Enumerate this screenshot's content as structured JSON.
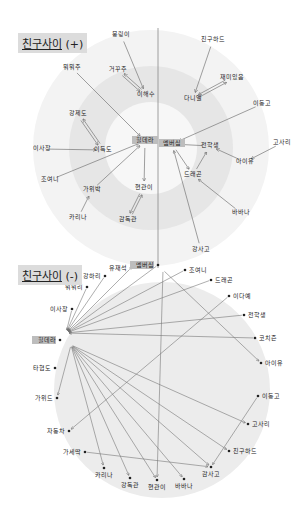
{
  "diagram_positive": {
    "title": "친구사이",
    "suffix": "(+)",
    "center": [
      151,
      148
    ],
    "rings": [
      {
        "r": 118,
        "color": "#f3f3f3"
      },
      {
        "r": 82,
        "color": "#e6e6e6"
      },
      {
        "r": 46,
        "color": "#f7f7f7"
      }
    ],
    "divider_x": 158,
    "nodes": [
      {
        "id": "p1",
        "label": "뭉링이",
        "x": 121,
        "y": 35
      },
      {
        "id": "p2",
        "label": "뭐뭐주",
        "x": 72,
        "y": 68
      },
      {
        "id": "p3",
        "label": "거꾸주",
        "x": 118,
        "y": 70
      },
      {
        "id": "p4",
        "label": "이해수",
        "x": 146,
        "y": 95
      },
      {
        "id": "p5",
        "label": "친구하드",
        "x": 213,
        "y": 40
      },
      {
        "id": "p6",
        "label": "재미있음",
        "x": 232,
        "y": 78
      },
      {
        "id": "p7",
        "label": "다니엘",
        "x": 193,
        "y": 99
      },
      {
        "id": "p8",
        "label": "이동고",
        "x": 262,
        "y": 104
      },
      {
        "id": "p9",
        "label": "강제도",
        "x": 78,
        "y": 114
      },
      {
        "id": "p10",
        "label": "이사장",
        "x": 42,
        "y": 149
      },
      {
        "id": "p11",
        "label": "이득도",
        "x": 103,
        "y": 150
      },
      {
        "id": "p12",
        "label": "힐데라",
        "x": 145,
        "y": 141,
        "highlight": true
      },
      {
        "id": "p13",
        "label": "멤버십",
        "x": 172,
        "y": 144,
        "highlight": true
      },
      {
        "id": "p14",
        "label": "전학생",
        "x": 210,
        "y": 146
      },
      {
        "id": "p15",
        "label": "고사리",
        "x": 282,
        "y": 143
      },
      {
        "id": "p16",
        "label": "아이유",
        "x": 245,
        "y": 162
      },
      {
        "id": "p17",
        "label": "조여니",
        "x": 50,
        "y": 180
      },
      {
        "id": "p18",
        "label": "가위박",
        "x": 92,
        "y": 190
      },
      {
        "id": "p19",
        "label": "현관이",
        "x": 144,
        "y": 188
      },
      {
        "id": "p20",
        "label": "드래곤",
        "x": 193,
        "y": 175
      },
      {
        "id": "p21",
        "label": "카리나",
        "x": 78,
        "y": 218
      },
      {
        "id": "p22",
        "label": "감독관",
        "x": 128,
        "y": 220
      },
      {
        "id": "p23",
        "label": "바바나",
        "x": 241,
        "y": 213
      },
      {
        "id": "p24",
        "label": "강사고",
        "x": 201,
        "y": 250
      }
    ],
    "edges": [
      {
        "from": "p1",
        "to": "p4",
        "type": "single"
      },
      {
        "from": "p3",
        "to": "p4",
        "type": "double"
      },
      {
        "from": "p2",
        "to": "p12",
        "type": "single"
      },
      {
        "from": "p5",
        "to": "p7",
        "type": "single"
      },
      {
        "from": "p6",
        "to": "p7",
        "type": "double"
      },
      {
        "from": "p9",
        "to": "p11",
        "type": "double"
      },
      {
        "from": "p10",
        "to": "p11",
        "type": "single"
      },
      {
        "from": "p17",
        "to": "p12",
        "type": "single"
      },
      {
        "from": "p18",
        "to": "p12",
        "type": "single"
      },
      {
        "from": "p21",
        "to": "p18",
        "type": "single"
      },
      {
        "from": "p12",
        "to": "p19",
        "type": "single"
      },
      {
        "from": "p22",
        "to": "p19",
        "type": "double"
      },
      {
        "from": "p8",
        "to": "p13",
        "type": "single"
      },
      {
        "from": "p14",
        "to": "p13",
        "type": "single"
      },
      {
        "from": "p16",
        "to": "p14",
        "type": "single"
      },
      {
        "from": "p15",
        "to": "p16",
        "type": "single"
      },
      {
        "from": "p13",
        "to": "p20",
        "type": "single"
      },
      {
        "from": "p20",
        "to": "p14",
        "type": "single"
      },
      {
        "from": "p23",
        "to": "p20",
        "type": "single"
      },
      {
        "from": "p24",
        "to": "p13",
        "type": "single"
      }
    ]
  },
  "diagram_negative": {
    "title": "친구사이",
    "suffix": "(-)",
    "circle": {
      "cx": 162,
      "cy": 390,
      "r": 108,
      "color": "#ececec"
    },
    "nodes": [
      {
        "id": "n1",
        "label": "유재석",
        "x": 131,
        "y": 268
      },
      {
        "id": "n2",
        "label": "멤버십",
        "x": 158,
        "y": 265,
        "highlight": true
      },
      {
        "id": "n3",
        "label": "강하리",
        "x": 105,
        "y": 276
      },
      {
        "id": "n4",
        "label": "조여니",
        "x": 185,
        "y": 270
      },
      {
        "id": "n5",
        "label": "뭐뭐리",
        "x": 87,
        "y": 287
      },
      {
        "id": "n6",
        "label": "드래곤",
        "x": 211,
        "y": 280
      },
      {
        "id": "n7",
        "label": "이사장",
        "x": 72,
        "y": 309
      },
      {
        "id": "n8",
        "label": "이다예",
        "x": 229,
        "y": 296
      },
      {
        "id": "n9",
        "label": "힐데라",
        "x": 60,
        "y": 340,
        "highlight": true
      },
      {
        "id": "n10",
        "label": "전학생",
        "x": 244,
        "y": 315
      },
      {
        "id": "n11",
        "label": "코치즌",
        "x": 255,
        "y": 338
      },
      {
        "id": "n12",
        "label": "타협도",
        "x": 55,
        "y": 368
      },
      {
        "id": "n13",
        "label": "아이유",
        "x": 261,
        "y": 363
      },
      {
        "id": "n14",
        "label": "가위드",
        "x": 57,
        "y": 398
      },
      {
        "id": "n15",
        "label": "이동고",
        "x": 258,
        "y": 396
      },
      {
        "id": "n16",
        "label": "자동차",
        "x": 69,
        "y": 431
      },
      {
        "id": "n17",
        "label": "고사리",
        "x": 248,
        "y": 424
      },
      {
        "id": "n18",
        "label": "가세딱",
        "x": 85,
        "y": 452
      },
      {
        "id": "n19",
        "label": "친구하드",
        "x": 229,
        "y": 451
      },
      {
        "id": "n20",
        "label": "카리나",
        "x": 104,
        "y": 468
      },
      {
        "id": "n21",
        "label": "강독관",
        "x": 130,
        "y": 478
      },
      {
        "id": "n22",
        "label": "현관이",
        "x": 157,
        "y": 480
      },
      {
        "id": "n23",
        "label": "바바나",
        "x": 184,
        "y": 479
      },
      {
        "id": "n24",
        "label": "감사고",
        "x": 211,
        "y": 467
      }
    ],
    "hub_points": [
      {
        "id": "h1",
        "x": 66,
        "y": 333
      },
      {
        "id": "h2",
        "x": 71,
        "y": 345
      },
      {
        "id": "h3",
        "x": 163,
        "y": 270
      }
    ],
    "edges": [
      {
        "from": "n1",
        "to": "h1"
      },
      {
        "from": "n3",
        "to": "h1"
      },
      {
        "from": "n5",
        "to": "h1"
      },
      {
        "from": "n7",
        "to": "h1"
      },
      {
        "from": "n2",
        "to": "h1"
      },
      {
        "from": "n4",
        "to": "h1"
      },
      {
        "from": "n6",
        "to": "h1"
      },
      {
        "from": "n8",
        "to": "n16"
      },
      {
        "from": "n10",
        "to": "h1"
      },
      {
        "from": "n11",
        "to": "h1"
      },
      {
        "from": "h2",
        "to": "n17"
      },
      {
        "from": "h2",
        "to": "n24"
      },
      {
        "from": "h2",
        "to": "n19"
      },
      {
        "from": "h2",
        "to": "n23"
      },
      {
        "from": "h2",
        "to": "n22"
      },
      {
        "from": "h2",
        "to": "n21"
      },
      {
        "from": "h2",
        "to": "n20"
      },
      {
        "from": "h2",
        "to": "n14"
      },
      {
        "from": "h3",
        "to": "n13"
      },
      {
        "from": "h3",
        "to": "n22"
      },
      {
        "from": "n18",
        "to": "n24"
      },
      {
        "from": "n15",
        "to": "n24"
      }
    ]
  },
  "colors": {
    "line": "#777777",
    "dot": "#222222",
    "highlight": "#bdbdbd",
    "title_bg": "#dcdcdc"
  }
}
